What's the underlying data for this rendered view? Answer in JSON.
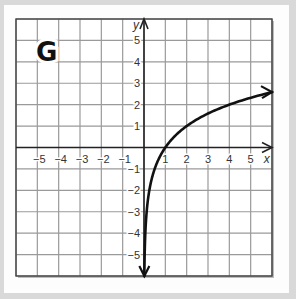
{
  "panel": {
    "label": "G"
  },
  "chart_data": {
    "type": "line",
    "title": "G",
    "xlabel": "x",
    "ylabel": "y",
    "xlim": [
      -6,
      6
    ],
    "ylim": [
      -6,
      6
    ],
    "grid": true,
    "x_ticks": [
      "-5",
      "-4",
      "-3",
      "-2",
      "-1",
      "1",
      "2",
      "3",
      "4",
      "5"
    ],
    "y_ticks": [
      "5",
      "4",
      "3",
      "2",
      "1",
      "-1",
      "-2",
      "-3",
      "-4",
      "-5"
    ],
    "function": "y = log2(x)",
    "series": [
      {
        "name": "curve",
        "x": [
          0.016,
          0.0625,
          0.125,
          0.25,
          0.5,
          1,
          2,
          4,
          6
        ],
        "y": [
          -6,
          -4,
          -3,
          -2,
          -1,
          0,
          1,
          2,
          2.58
        ]
      }
    ],
    "annotations": [
      "arrow at lower end (toward y=-6)",
      "arrow at upper right end (x=6)"
    ]
  },
  "colors": {
    "curve": "#111111",
    "grid": "#9a9a9a",
    "axis": "#222222",
    "background": "#d9d9d9",
    "card": "#fdfdfd"
  }
}
